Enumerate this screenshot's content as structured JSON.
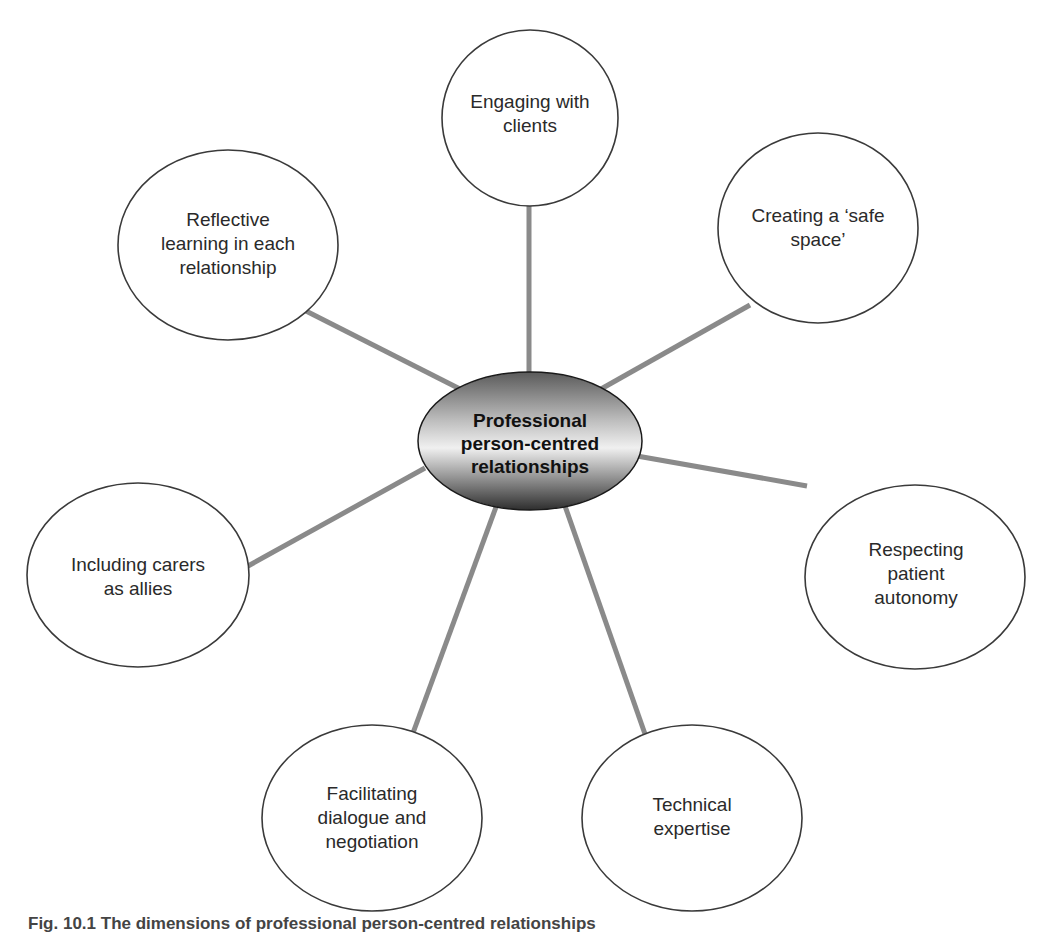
{
  "diagram": {
    "center": {
      "label": "Professional\nperson-centred\nrelationships",
      "cx": 530,
      "cy": 441,
      "rx": 112,
      "ry": 69
    },
    "nodes": [
      {
        "id": "engaging",
        "label": "Engaging with\nclients",
        "cx": 530,
        "cy": 118,
        "rx": 88,
        "ry": 88,
        "lx": 530,
        "ly": 114
      },
      {
        "id": "creating",
        "label": "Creating a ‘safe\nspace’",
        "cx": 818,
        "cy": 228,
        "rx": 100,
        "ry": 95,
        "lx": 818,
        "ly": 228
      },
      {
        "id": "respecting",
        "label": "Respecting\npatient autonomy",
        "cx": 915,
        "cy": 577,
        "rx": 110,
        "ry": 92,
        "lx": 916,
        "ly": 574
      },
      {
        "id": "technical",
        "label": "Technical\nexpertise",
        "cx": 692,
        "cy": 818,
        "rx": 110,
        "ry": 93,
        "lx": 692,
        "ly": 817
      },
      {
        "id": "facilitating",
        "label": "Facilitating\ndialogue and\nnegotiation",
        "cx": 372,
        "cy": 818,
        "rx": 110,
        "ry": 93,
        "lx": 372,
        "ly": 818
      },
      {
        "id": "including",
        "label": "Including carers\nas allies",
        "cx": 138,
        "cy": 575,
        "rx": 111,
        "ry": 92,
        "lx": 138,
        "ly": 577
      },
      {
        "id": "reflective",
        "label": "Reflective\nlearning in each\nrelationship",
        "cx": 228,
        "cy": 245,
        "rx": 110,
        "ry": 95,
        "lx": 228,
        "ly": 244
      }
    ],
    "connectors": [
      {
        "to": "engaging",
        "x1": 529,
        "y1": 372,
        "x2": 529,
        "y2": 206
      },
      {
        "to": "creating",
        "x1": 601,
        "y1": 389,
        "x2": 750,
        "y2": 305
      },
      {
        "to": "respecting",
        "x1": 637,
        "y1": 456,
        "x2": 807,
        "y2": 486
      },
      {
        "to": "technical",
        "x1": 565,
        "y1": 506,
        "x2": 645,
        "y2": 734
      },
      {
        "to": "facilitating",
        "x1": 496,
        "y1": 507,
        "x2": 413,
        "y2": 733
      },
      {
        "to": "including",
        "x1": 425,
        "y1": 468,
        "x2": 248,
        "y2": 566
      },
      {
        "to": "reflective",
        "x1": 460,
        "y1": 389,
        "x2": 306,
        "y2": 311
      }
    ],
    "colors": {
      "node_stroke": "#3a3a3a",
      "connector": "#8a8a8a",
      "center_light": "#f2f2f2",
      "center_dark": "#3c3c3c"
    }
  },
  "caption": "Fig. 10.1  The dimensions of professional person-centred relationships"
}
